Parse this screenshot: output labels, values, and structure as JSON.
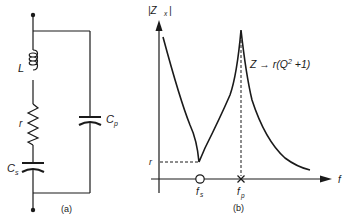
{
  "figure": {
    "panel_a": {
      "caption": "(a)",
      "components": {
        "inductor_label": "L",
        "resistor_label": "r",
        "series_cap_label": "C",
        "series_cap_sub": "s",
        "parallel_cap_label": "C",
        "parallel_cap_sub": "p"
      }
    },
    "panel_b": {
      "caption": "(b)",
      "y_axis_label": "|Z",
      "y_axis_sub": "x",
      "y_axis_close": "|",
      "x_axis_label": "f",
      "r_level_label": "r",
      "fs_label": "f",
      "fs_sub": "s",
      "fp_label": "f",
      "fp_sub": "p",
      "annotation": "Z → r(Q",
      "annotation_sup": "2",
      "annotation_tail": " +1)"
    },
    "colors": {
      "ink": "#1a1a1a",
      "background": "#ffffff"
    }
  }
}
